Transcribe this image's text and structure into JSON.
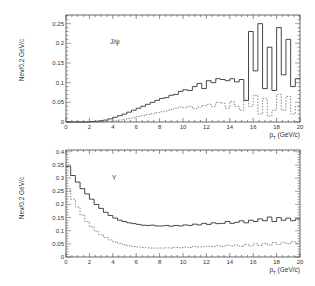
{
  "chart_data": [
    {
      "type": "line",
      "style": "step-histogram",
      "title": "",
      "annotation": "J/ψ",
      "xlabel": "p_T (GeV/c)",
      "ylabel": "Nev/0.2 GeV/c",
      "xlim": [
        0,
        20
      ],
      "ylim": [
        0,
        0.275
      ],
      "xticks": [
        0,
        2,
        4,
        6,
        8,
        10,
        12,
        14,
        16,
        18,
        20
      ],
      "yticks": [
        0,
        0.05,
        0.1,
        0.15,
        0.2,
        0.25
      ],
      "ytick_labels": [
        "0",
        "0.05",
        "0.1",
        "0.15",
        "0.2",
        "0.25"
      ],
      "grid": false,
      "bin_width": 0.4,
      "x": [
        0,
        0.4,
        0.8,
        1.2,
        1.6,
        2.0,
        2.4,
        2.8,
        3.2,
        3.6,
        4.0,
        4.4,
        4.8,
        5.2,
        5.6,
        6.0,
        6.4,
        6.8,
        7.2,
        7.6,
        8.0,
        8.4,
        8.8,
        9.2,
        9.6,
        10.0,
        10.4,
        10.8,
        11.2,
        11.6,
        12.0,
        12.4,
        12.8,
        13.2,
        13.6,
        14.0,
        14.4,
        14.8,
        15.2,
        15.6,
        16.0,
        16.4,
        16.8,
        17.2,
        17.6,
        18.0,
        18.4,
        18.8,
        19.2,
        19.6
      ],
      "series": [
        {
          "name": "solid",
          "line": "solid",
          "values": [
            0,
            0,
            0,
            0,
            0,
            0.001,
            0.002,
            0.003,
            0.005,
            0.008,
            0.012,
            0.016,
            0.02,
            0.025,
            0.03,
            0.035,
            0.04,
            0.045,
            0.05,
            0.055,
            0.06,
            0.062,
            0.068,
            0.07,
            0.078,
            0.082,
            0.08,
            0.09,
            0.098,
            0.085,
            0.105,
            0.1,
            0.11,
            0.108,
            0.105,
            0.11,
            0.102,
            0.108,
            0.055,
            0.23,
            0.13,
            0.25,
            0.085,
            0.19,
            0.08,
            0.24,
            0.12,
            0.21,
            0.09,
            0.11
          ]
        },
        {
          "name": "dashed",
          "line": "dashed",
          "values": [
            0,
            0,
            0,
            0,
            0,
            0,
            0,
            0,
            0.001,
            0.002,
            0.003,
            0.005,
            0.007,
            0.009,
            0.011,
            0.014,
            0.016,
            0.019,
            0.021,
            0.024,
            0.026,
            0.028,
            0.032,
            0.035,
            0.038,
            0.036,
            0.04,
            0.034,
            0.038,
            0.042,
            0.045,
            0.04,
            0.05,
            0.048,
            0.035,
            0.052,
            0.04,
            0.03,
            0.055,
            0.04,
            0.068,
            0.02,
            0.06,
            0.015,
            0.03,
            0.07,
            0.03,
            0.065,
            0.02,
            0.04
          ]
        }
      ]
    },
    {
      "type": "line",
      "style": "step-histogram",
      "title": "",
      "annotation": "Υ",
      "xlabel": "p_T (GeV/c)",
      "ylabel": "Nev/0.2 GeV/c",
      "xlim": [
        0,
        20
      ],
      "ylim": [
        0,
        0.41
      ],
      "xticks": [
        0,
        2,
        4,
        6,
        8,
        10,
        12,
        14,
        16,
        18,
        20
      ],
      "yticks": [
        0,
        0.05,
        0.1,
        0.15,
        0.2,
        0.25,
        0.3,
        0.35,
        0.4
      ],
      "ytick_labels": [
        "0",
        "0.05",
        "0.1",
        "0.15",
        "0.2",
        "0.25",
        "0.3",
        "0.35",
        "0.4"
      ],
      "grid": false,
      "bin_width": 0.4,
      "x": [
        0,
        0.4,
        0.8,
        1.2,
        1.6,
        2.0,
        2.4,
        2.8,
        3.2,
        3.6,
        4.0,
        4.4,
        4.8,
        5.2,
        5.6,
        6.0,
        6.4,
        6.8,
        7.2,
        7.6,
        8.0,
        8.4,
        8.8,
        9.2,
        9.6,
        10.0,
        10.4,
        10.8,
        11.2,
        11.6,
        12.0,
        12.4,
        12.8,
        13.2,
        13.6,
        14.0,
        14.4,
        14.8,
        15.2,
        15.6,
        16.0,
        16.4,
        16.8,
        17.2,
        17.6,
        18.0,
        18.4,
        18.8,
        19.2,
        19.6
      ],
      "series": [
        {
          "name": "solid",
          "line": "solid",
          "values": [
            0.345,
            0.31,
            0.285,
            0.26,
            0.24,
            0.22,
            0.2,
            0.185,
            0.17,
            0.158,
            0.148,
            0.14,
            0.135,
            0.13,
            0.127,
            0.124,
            0.121,
            0.12,
            0.121,
            0.118,
            0.118,
            0.12,
            0.117,
            0.12,
            0.118,
            0.122,
            0.12,
            0.125,
            0.122,
            0.128,
            0.124,
            0.13,
            0.127,
            0.128,
            0.135,
            0.128,
            0.132,
            0.138,
            0.13,
            0.14,
            0.135,
            0.145,
            0.138,
            0.152,
            0.135,
            0.15,
            0.14,
            0.148,
            0.138,
            0.145
          ]
        },
        {
          "name": "dashed",
          "line": "dashed",
          "values": [
            0.26,
            0.22,
            0.19,
            0.16,
            0.135,
            0.115,
            0.098,
            0.085,
            0.074,
            0.065,
            0.058,
            0.052,
            0.047,
            0.043,
            0.04,
            0.038,
            0.036,
            0.035,
            0.034,
            0.034,
            0.034,
            0.035,
            0.034,
            0.036,
            0.035,
            0.038,
            0.036,
            0.04,
            0.038,
            0.04,
            0.041,
            0.04,
            0.043,
            0.04,
            0.045,
            0.042,
            0.046,
            0.04,
            0.048,
            0.042,
            0.05,
            0.044,
            0.052,
            0.045,
            0.055,
            0.048,
            0.056,
            0.05,
            0.058,
            0.052
          ]
        }
      ]
    }
  ]
}
